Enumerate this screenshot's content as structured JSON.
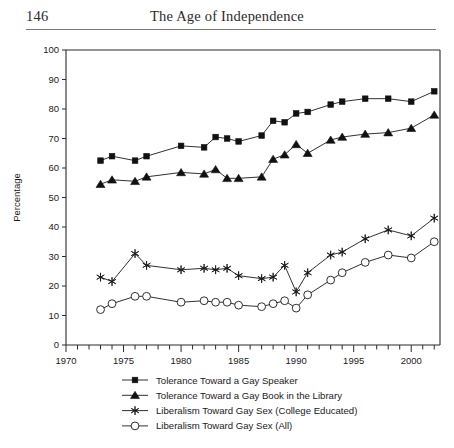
{
  "page": {
    "folio": "146",
    "running_title": "The Age of Independence"
  },
  "chart_data": {
    "type": "line",
    "title": "",
    "xlabel": "",
    "ylabel": "Percentage",
    "xlim": [
      1970,
      2002.5
    ],
    "ylim": [
      0,
      100
    ],
    "ytick_step": 10,
    "yticks": [
      "0",
      "10",
      "20",
      "30",
      "40",
      "50",
      "60",
      "70",
      "80",
      "90",
      "100"
    ],
    "xticks_major": [
      "1970",
      "1975",
      "1980",
      "1985",
      "1990",
      "1995",
      "2000"
    ],
    "xtick_minor_step": 1,
    "grid": false,
    "legend_position": "below",
    "series": [
      {
        "name": "Tolerance Toward  a Gay Speaker",
        "marker": "filled-square",
        "color": "#111111",
        "x": [
          1973,
          1974,
          1976,
          1977,
          1980,
          1982,
          1983,
          1984,
          1985,
          1987,
          1988,
          1989,
          1990,
          1991,
          1993,
          1994,
          1996,
          1998,
          2000,
          2002
        ],
        "values": [
          62.5,
          64,
          62.5,
          64,
          67.5,
          67,
          70.5,
          70,
          69,
          71,
          76,
          75.5,
          78.5,
          79,
          81.5,
          82.5,
          83.5,
          83.5,
          82.5,
          86
        ]
      },
      {
        "name": "Tolerance Toward a Gay Book in the Library",
        "marker": "filled-triangle",
        "color": "#111111",
        "x": [
          1973,
          1974,
          1976,
          1977,
          1980,
          1982,
          1983,
          1984,
          1985,
          1987,
          1988,
          1989,
          1990,
          1991,
          1993,
          1994,
          1996,
          1998,
          2000,
          2002
        ],
        "values": [
          54.5,
          56,
          55.5,
          57,
          58.5,
          58,
          59.5,
          56.5,
          56.5,
          57,
          63,
          64.5,
          68,
          65,
          69.5,
          70.5,
          71.5,
          72,
          73.5,
          78
        ]
      },
      {
        "name": "Liberalism Toward Gay Sex (College Educated)",
        "marker": "star",
        "color": "#1a1a1a",
        "x": [
          1973,
          1974,
          1976,
          1977,
          1980,
          1982,
          1983,
          1984,
          1985,
          1987,
          1988,
          1989,
          1990,
          1991,
          1993,
          1994,
          1996,
          1998,
          2000,
          2002
        ],
        "values": [
          23,
          21.5,
          31,
          27,
          25.5,
          26,
          25.5,
          26,
          23.5,
          22.5,
          23,
          27,
          18,
          24.5,
          30.5,
          31.5,
          36,
          39,
          37,
          43
        ]
      },
      {
        "name": "Liberalism Toward Gay Sex (All)",
        "marker": "open-circle",
        "color": "#1a1a1a",
        "x": [
          1973,
          1974,
          1976,
          1977,
          1980,
          1982,
          1983,
          1984,
          1985,
          1987,
          1988,
          1989,
          1990,
          1991,
          1993,
          1994,
          1996,
          1998,
          2000,
          2002
        ],
        "values": [
          12,
          14,
          16.5,
          16.5,
          14.5,
          15,
          14.5,
          14.5,
          13.5,
          13,
          14,
          15,
          12.5,
          17,
          22,
          24.5,
          28,
          30.5,
          29.5,
          35
        ]
      }
    ]
  },
  "legend": {
    "items": [
      {
        "label": "Tolerance Toward  a Gay Speaker",
        "marker": "filled-square"
      },
      {
        "label": "Tolerance Toward a Gay Book in the Library",
        "marker": "filled-triangle"
      },
      {
        "label": "Liberalism Toward Gay Sex (College Educated)",
        "marker": "star"
      },
      {
        "label": "Liberalism Toward Gay Sex (All)",
        "marker": "open-circle"
      }
    ]
  }
}
